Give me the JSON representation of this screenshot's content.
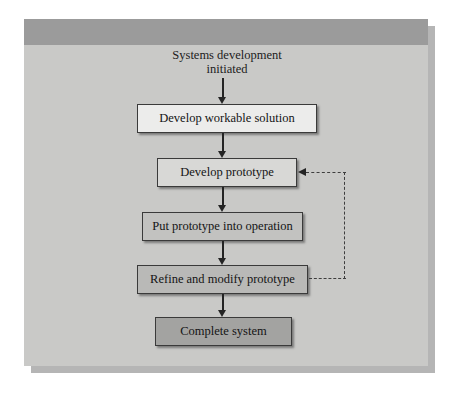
{
  "diagram": {
    "start_label": "Systems development\ninitiated",
    "nodes": [
      {
        "id": "develop-workable-solution",
        "label": "Develop workable solution",
        "fill": "#ececeb"
      },
      {
        "id": "develop-prototype",
        "label": "Develop prototype",
        "fill": "#d8d8d6"
      },
      {
        "id": "put-prototype-into-operation",
        "label": "Put prototype into operation",
        "fill": "#c2c2c0"
      },
      {
        "id": "refine-and-modify-prototype",
        "label": "Refine and modify prototype",
        "fill": "#b9b9b7"
      },
      {
        "id": "complete-system",
        "label": "Complete system",
        "fill": "#a3a3a1"
      }
    ],
    "connectors": [
      {
        "from": "start",
        "to": "develop-workable-solution",
        "style": "solid",
        "direction": "down"
      },
      {
        "from": "develop-workable-solution",
        "to": "develop-prototype",
        "style": "solid",
        "direction": "down"
      },
      {
        "from": "develop-prototype",
        "to": "put-prototype-into-operation",
        "style": "solid",
        "direction": "down"
      },
      {
        "from": "put-prototype-into-operation",
        "to": "refine-and-modify-prototype",
        "style": "solid",
        "direction": "down"
      },
      {
        "from": "refine-and-modify-prototype",
        "to": "complete-system",
        "style": "solid",
        "direction": "down"
      },
      {
        "from": "refine-and-modify-prototype",
        "to": "develop-prototype",
        "style": "dashed",
        "direction": "feedback-loop"
      }
    ],
    "colors": {
      "panel_background": "#c9c9c7",
      "panel_header": "#9b9b9b",
      "panel_shadow": "#9c9c9c",
      "line": "#242424",
      "dashed_line": "#3d3d3d",
      "text": "#141414"
    }
  }
}
